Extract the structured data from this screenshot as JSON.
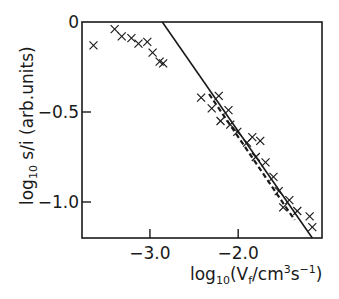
{
  "chart_data": {
    "type": "scatter",
    "title": "",
    "xlabel": "log10(Vf/cm3s-1)",
    "ylabel": "log10 s/i (arb.units)",
    "xlim": [
      -3.77,
      -1.05
    ],
    "ylim": [
      -1.2,
      0
    ],
    "grid": false,
    "legend": null,
    "x_ticks": [
      -3.0,
      -2.0
    ],
    "x_tick_labels": [
      "−3.0",
      "−2.0"
    ],
    "y_ticks": [
      0,
      -0.5,
      -1.0
    ],
    "y_tick_labels": [
      "0",
      "−0.5",
      "−1.0"
    ],
    "series": [
      {
        "name": "measured",
        "marker": "x",
        "points": [
          [
            -3.64,
            -0.13
          ],
          [
            -3.4,
            -0.04
          ],
          [
            -3.32,
            -0.08
          ],
          [
            -3.21,
            -0.09
          ],
          [
            -3.13,
            -0.12
          ],
          [
            -3.03,
            -0.11
          ],
          [
            -2.97,
            -0.17
          ],
          [
            -2.89,
            -0.22
          ],
          [
            -2.85,
            -0.23
          ],
          [
            -2.42,
            -0.42
          ],
          [
            -2.22,
            -0.41
          ],
          [
            -2.3,
            -0.48
          ],
          [
            -2.11,
            -0.49
          ],
          [
            -2.2,
            -0.55
          ],
          [
            -2.09,
            -0.57
          ],
          [
            -2.01,
            -0.61
          ],
          [
            -1.9,
            -0.67
          ],
          [
            -1.84,
            -0.64
          ],
          [
            -1.75,
            -0.66
          ],
          [
            -1.8,
            -0.75
          ],
          [
            -1.69,
            -0.78
          ],
          [
            -1.6,
            -0.86
          ],
          [
            -1.54,
            -0.94
          ],
          [
            -1.42,
            -0.99
          ],
          [
            -1.49,
            -1.03
          ],
          [
            -1.33,
            -1.05
          ],
          [
            -1.19,
            -1.08
          ],
          [
            -1.16,
            -1.14
          ]
        ]
      }
    ],
    "lines": [
      {
        "name": "fit-line",
        "style": "solid",
        "from": [
          -2.86,
          0.0
        ],
        "to": [
          -1.16,
          -1.2
        ]
      },
      {
        "name": "dashed-trend",
        "style": "dashed",
        "from": [
          -2.33,
          -0.4
        ],
        "to": [
          -1.36,
          -1.1
        ]
      }
    ]
  },
  "labels": {
    "x_axis": {
      "main": "log",
      "sub": "10",
      "paren_open": "(V",
      "vsub": "f",
      "unit": "/cm",
      "sup3": "3",
      "s": "s",
      "supm1": "−1",
      "paren_close": ")"
    },
    "y_axis": {
      "main": "log",
      "sub": "10",
      "rest": " s/i (arb.units)"
    }
  }
}
